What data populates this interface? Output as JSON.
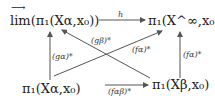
{
  "diagram": {
    "type": "commutative-diagram",
    "nodes": {
      "top_left": "lim(π₁(Xα,x₀))",
      "top_left_arrow_over": "⟶",
      "top_right": "π₁(X^∞,x₀)",
      "bottom_left": "π₁(Xα,x₀)",
      "bottom_right": "π₁(Xβ,x₀)"
    },
    "arrows": {
      "top": "h",
      "left": "(gα)*",
      "right": "(fα)*",
      "bottom": "(fαβ)*",
      "diag_up_left": "(gβ)*",
      "diag_up_right": "(fα)*"
    }
  }
}
